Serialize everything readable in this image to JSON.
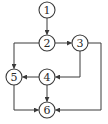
{
  "diagram": {
    "type": "control-flow-graph",
    "stroke_color": "#3a3a3a",
    "nodes": [
      {
        "id": "1",
        "label": "1",
        "x": 47,
        "y": 10
      },
      {
        "id": "2",
        "label": "2",
        "x": 47,
        "y": 43
      },
      {
        "id": "3",
        "label": "3",
        "x": 80,
        "y": 43
      },
      {
        "id": "4",
        "label": "4",
        "x": 47,
        "y": 77
      },
      {
        "id": "5",
        "label": "5",
        "x": 14,
        "y": 77
      },
      {
        "id": "6",
        "label": "6",
        "x": 47,
        "y": 110
      }
    ],
    "edges": [
      {
        "from": "1",
        "to": "2"
      },
      {
        "from": "2",
        "to": "3"
      },
      {
        "from": "2",
        "to": "5"
      },
      {
        "from": "3",
        "to": "4"
      },
      {
        "from": "3",
        "to": "6"
      },
      {
        "from": "4",
        "to": "5"
      },
      {
        "from": "4",
        "to": "6"
      },
      {
        "from": "5",
        "to": "6"
      }
    ]
  }
}
